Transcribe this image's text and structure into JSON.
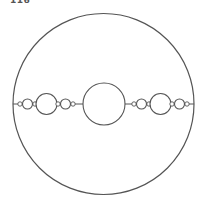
{
  "figure": {
    "label": "116",
    "stroke_color": "#555555",
    "background_color": "#ffffff",
    "chain": {
      "left": [
        {
          "kind": "tiny"
        },
        {
          "kind": "medium"
        },
        {
          "kind": "tiny"
        },
        {
          "kind": "large"
        },
        {
          "kind": "tiny"
        },
        {
          "kind": "medium"
        },
        {
          "kind": "tiny"
        }
      ],
      "center": {
        "kind": "central"
      },
      "right": [
        {
          "kind": "tiny"
        },
        {
          "kind": "medium"
        },
        {
          "kind": "tiny"
        },
        {
          "kind": "large"
        },
        {
          "kind": "tiny"
        },
        {
          "kind": "medium"
        },
        {
          "kind": "tiny"
        }
      ]
    }
  }
}
